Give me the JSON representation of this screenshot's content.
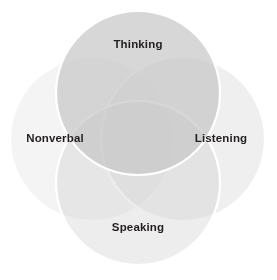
{
  "diagram": {
    "type": "venn",
    "title": "",
    "background_color": "#ffffff",
    "stroke_color": "#ffffff",
    "label_color": "#231f20",
    "circles": [
      {
        "id": "thinking",
        "label": "Thinking",
        "position": "top",
        "center_x": 138,
        "center_y": 93,
        "radius": 82,
        "fill": "#c8c8c8",
        "opacity": 0.72,
        "label_x": 138,
        "label_y": 45
      },
      {
        "id": "listening",
        "label": "Listening",
        "position": "right",
        "center_x": 183,
        "center_y": 139,
        "radius": 82,
        "fill": "#dcdcdc",
        "opacity": 0.45,
        "label_x": 221,
        "label_y": 139
      },
      {
        "id": "speaking",
        "label": "Speaking",
        "position": "bottom",
        "center_x": 138,
        "center_y": 183,
        "radius": 82,
        "fill": "#d2d2d2",
        "opacity": 0.4,
        "label_x": 138,
        "label_y": 228
      },
      {
        "id": "nonverbal",
        "label": "Nonverbal",
        "position": "left",
        "center_x": 92,
        "center_y": 139,
        "radius": 82,
        "fill": "#e2e2e2",
        "opacity": 0.38,
        "label_x": 55,
        "label_y": 139
      }
    ]
  }
}
